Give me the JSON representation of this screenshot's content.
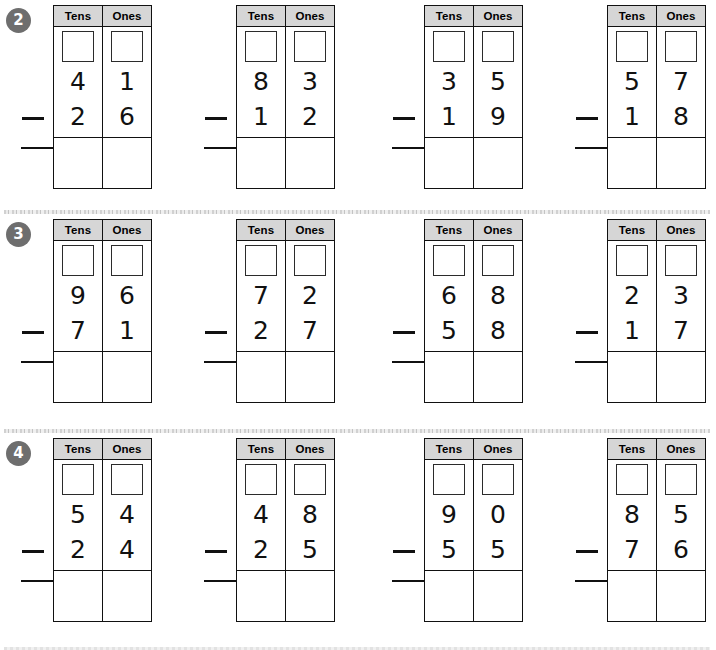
{
  "worksheet": {
    "column_headers": [
      "Tens",
      "Ones"
    ],
    "operator": "minus-sign",
    "rows": [
      {
        "number": "2",
        "problems": [
          {
            "minuend_tens": "4",
            "minuend_ones": "1",
            "subtrahend_tens": "2",
            "subtrahend_ones": "6",
            "minuend": "41",
            "subtrahend": "26",
            "answer_tens": "",
            "answer_ones": ""
          },
          {
            "minuend_tens": "8",
            "minuend_ones": "3",
            "subtrahend_tens": "1",
            "subtrahend_ones": "2",
            "minuend": "83",
            "subtrahend": "12",
            "answer_tens": "",
            "answer_ones": ""
          },
          {
            "minuend_tens": "3",
            "minuend_ones": "5",
            "subtrahend_tens": "1",
            "subtrahend_ones": "9",
            "minuend": "35",
            "subtrahend": "19",
            "answer_tens": "",
            "answer_ones": ""
          },
          {
            "minuend_tens": "5",
            "minuend_ones": "7",
            "subtrahend_tens": "1",
            "subtrahend_ones": "8",
            "minuend": "57",
            "subtrahend": "18",
            "answer_tens": "",
            "answer_ones": ""
          }
        ]
      },
      {
        "number": "3",
        "problems": [
          {
            "minuend_tens": "9",
            "minuend_ones": "6",
            "subtrahend_tens": "7",
            "subtrahend_ones": "1",
            "minuend": "96",
            "subtrahend": "71",
            "answer_tens": "",
            "answer_ones": ""
          },
          {
            "minuend_tens": "7",
            "minuend_ones": "2",
            "subtrahend_tens": "2",
            "subtrahend_ones": "7",
            "minuend": "72",
            "subtrahend": "27",
            "answer_tens": "",
            "answer_ones": ""
          },
          {
            "minuend_tens": "6",
            "minuend_ones": "8",
            "subtrahend_tens": "5",
            "subtrahend_ones": "8",
            "minuend": "68",
            "subtrahend": "58",
            "answer_tens": "",
            "answer_ones": ""
          },
          {
            "minuend_tens": "2",
            "minuend_ones": "3",
            "subtrahend_tens": "1",
            "subtrahend_ones": "7",
            "minuend": "23",
            "subtrahend": "17",
            "answer_tens": "",
            "answer_ones": ""
          }
        ]
      },
      {
        "number": "4",
        "problems": [
          {
            "minuend_tens": "5",
            "minuend_ones": "4",
            "subtrahend_tens": "2",
            "subtrahend_ones": "4",
            "minuend": "54",
            "subtrahend": "24",
            "answer_tens": "",
            "answer_ones": ""
          },
          {
            "minuend_tens": "4",
            "minuend_ones": "8",
            "subtrahend_tens": "2",
            "subtrahend_ones": "5",
            "minuend": "48",
            "subtrahend": "25",
            "answer_tens": "",
            "answer_ones": ""
          },
          {
            "minuend_tens": "9",
            "minuend_ones": "0",
            "subtrahend_tens": "5",
            "subtrahend_ones": "5",
            "minuend": "90",
            "subtrahend": "55",
            "answer_tens": "",
            "answer_ones": ""
          },
          {
            "minuend_tens": "8",
            "minuend_ones": "5",
            "subtrahend_tens": "7",
            "subtrahend_ones": "6",
            "minuend": "85",
            "subtrahend": "76",
            "answer_tens": "",
            "answer_ones": ""
          }
        ]
      }
    ]
  },
  "colors": {
    "badge_fill": "#6e6e6e",
    "badge_text": "#ffffff",
    "header_fill": "#d6d6d6",
    "grid_line": "#111111",
    "divider": "#cccccc"
  }
}
